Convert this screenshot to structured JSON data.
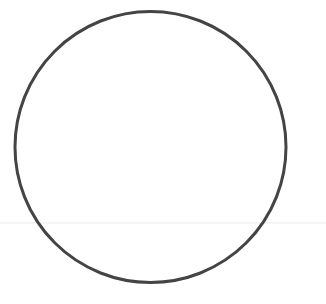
{
  "diagram": {
    "background": "#ffffff",
    "circle": {
      "cx": 150.5,
      "cy": 147,
      "r": 135.5,
      "stroke": "#444444",
      "stroke_width": 3
    },
    "horizontal_line": {
      "y": 223,
      "x1": 0,
      "x2": 326,
      "stroke": "#ebebeb",
      "stroke_width": 1
    }
  }
}
